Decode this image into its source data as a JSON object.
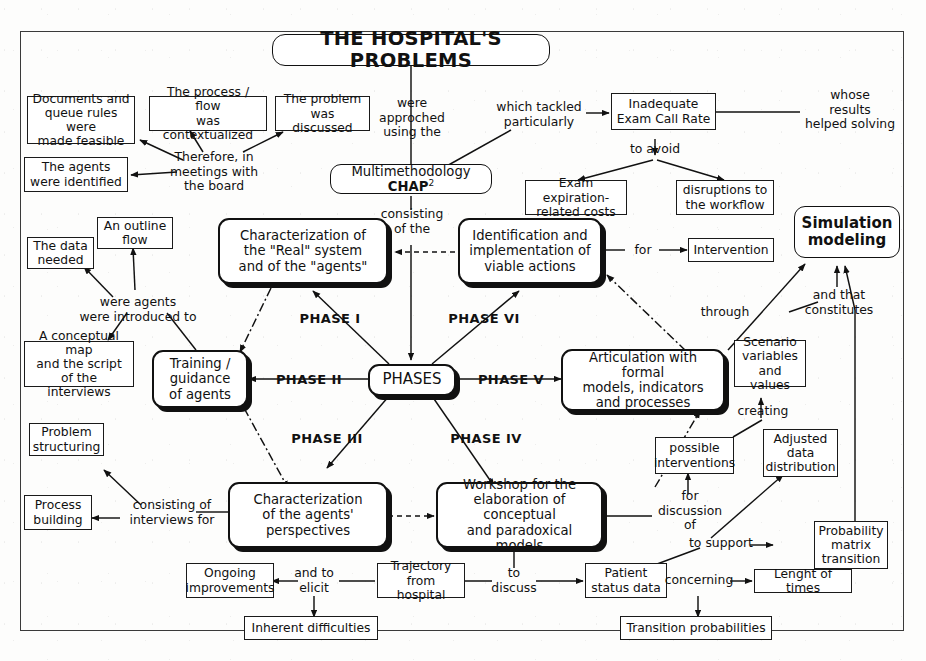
{
  "diagram": {
    "title": "THE HOSPITAL'S PROBLEMS",
    "type": "concept-map",
    "center": "PHASES"
  },
  "nodes": {
    "title": "THE HOSPITAL'S PROBLEMS",
    "documents_queue": "Documents and\nqueue rules were\nmade feasible",
    "process_flow": "The process / flow\nwas contextualized",
    "problem_discussed": "The problem\nwas discussed",
    "agents_identified": "The agents\nwere identified",
    "inadequate_exam": "Inadequate\nExam Call Rate",
    "multimethodology_pre": "Multimethodology ",
    "multimethodology_bold": "CHAP",
    "multimethodology_sup": "2",
    "exam_expiration": "Exam expiration-\nrelated costs",
    "disruptions": "disruptions to\nthe workflow",
    "simulation_modeling": "Simulation\nmodeling",
    "an_outline_flow": "An outline\nflow",
    "the_data_needed": "The data\nneeded",
    "conceptual_map": "A conceptual map\nand the script\nof the interviews",
    "characterization_real": "Characterization of\nthe \"Real\" system\nand of the \"agents\"",
    "identification_viable": "Identification and\nimplementation of\nviable actions",
    "intervention": "Intervention",
    "training_guidance": "Training /\nguidance\nof agents",
    "phases": "PHASES",
    "articulation_formal": "Articulation with formal\nmodels, indicators\nand processes",
    "scenario_variables": "Scenario\nvariables\nand values",
    "problem_structuring": "Problem\nstructuring",
    "process_building": "Process\nbuilding",
    "characterization_agents": "Characterization\nof the agents'\nperspectives",
    "workshop": "Workshop for the\nelaboration of conceptual\nand paradoxical models",
    "possible_interventions": "possible\ninterventions",
    "adjusted_data": "Adjusted\ndata\ndistribution",
    "probability_matrix": "Probability\nmatrix\ntransition",
    "ongoing_improvements": "Ongoing\nimprovements",
    "trajectory_hospital": "Trajectory\nfrom hospital",
    "patient_status": "Patient\nstatus data",
    "lenght_of_times": "Lenght of times",
    "inherent_difficulties": "Inherent difficulties",
    "transition_probabilities": "Transition probabilities"
  },
  "edge_labels": {
    "were_approched": "were\napproched\nusing the",
    "which_tackled": "which tackled\nparticularly",
    "whose_results": "whose\nresults\nhelped solving",
    "therefore_meetings": "Therefore, in\nmeetings with\nthe board",
    "to_avoid": "to avoid",
    "consisting_of_the": "consisting\nof the",
    "were_agents_introduced": "were agents\nwere introduced to",
    "for": "for",
    "through": "through",
    "and_that_constitutes": "and that\nconstitutes",
    "creating": "creating",
    "consisting_interviews": "consisting of\ninterviews for",
    "for_discussion_of": "for\ndiscussion\nof",
    "to_support": "to support",
    "concerning": "concerning",
    "and_to_elicit": "and to\nelicit",
    "to_discuss": "to\ndiscuss",
    "phase_1": "PHASE I",
    "phase_2": "PHASE II",
    "phase_3": "PHASE III",
    "phase_4": "PHASE IV",
    "phase_5": "PHASE V",
    "phase_6": "PHASE VI"
  },
  "colors": {
    "ink": "#111111",
    "paper": "#fdfdfc",
    "frame": "#3a3a3a"
  }
}
